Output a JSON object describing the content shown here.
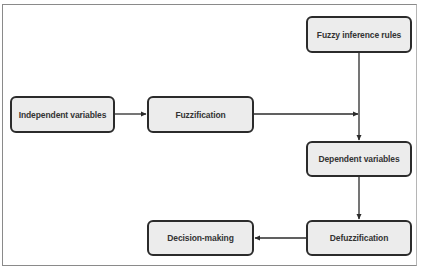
{
  "diagram": {
    "type": "flowchart",
    "nodes": [
      {
        "id": "independent",
        "label": "Independent variables"
      },
      {
        "id": "fuzzification",
        "label": "Fuzzification"
      },
      {
        "id": "rules",
        "label": "Fuzzy inference rules"
      },
      {
        "id": "dependent",
        "label": "Dependent variables"
      },
      {
        "id": "defuzzification",
        "label": "Defuzzification"
      },
      {
        "id": "decision",
        "label": "Decision-making"
      }
    ],
    "edges": [
      {
        "from": "independent",
        "to": "fuzzification"
      },
      {
        "from": "fuzzification",
        "to": "rules-line-junction"
      },
      {
        "from": "rules",
        "to": "dependent"
      },
      {
        "from": "dependent",
        "to": "defuzzification"
      },
      {
        "from": "defuzzification",
        "to": "decision"
      }
    ],
    "colors": {
      "node_fill": "#ececec",
      "node_border": "#2b2b2b",
      "line": "#2b2b2b",
      "text": "#333333"
    }
  }
}
